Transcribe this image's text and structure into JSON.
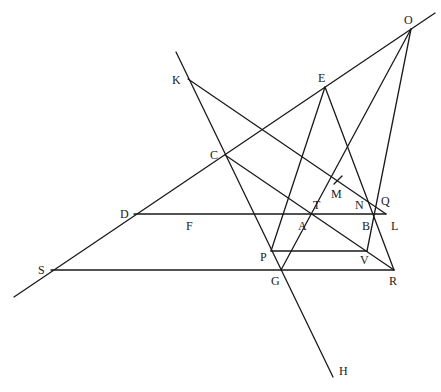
{
  "diagram": {
    "type": "geometric-construction",
    "stroke_color": "#1a1a1a",
    "background": "#ffffff",
    "points": [
      {
        "id": "O",
        "x": 411,
        "y": 29,
        "label_x": 404,
        "label_y": 24
      },
      {
        "id": "E",
        "x": 325,
        "y": 87,
        "label_x": 318,
        "label_y": 82
      },
      {
        "id": "K",
        "x": 188,
        "y": 79,
        "label_x": 172,
        "label_y": 84
      },
      {
        "id": "C",
        "x": 225,
        "y": 155,
        "label_x": 210,
        "label_y": 159
      },
      {
        "id": "M",
        "x": 338,
        "y": 180,
        "label_x": 331,
        "label_y": 198
      },
      {
        "id": "T",
        "x": 314,
        "y": 214,
        "label_x": 313,
        "label_y": 209
      },
      {
        "id": "N",
        "x": 369,
        "y": 214,
        "label_x": 355,
        "label_y": 209
      },
      {
        "id": "Q",
        "x": 372,
        "y": 205,
        "label_x": 381,
        "label_y": 205
      },
      {
        "id": "D",
        "x": 134,
        "y": 214,
        "label_x": 120,
        "label_y": 218
      },
      {
        "id": "F",
        "x": 197,
        "y": 214,
        "label_x": 186,
        "label_y": 230
      },
      {
        "id": "A",
        "x": 296,
        "y": 214,
        "label_x": 298,
        "label_y": 230
      },
      {
        "id": "B",
        "x": 374,
        "y": 214,
        "label_x": 362,
        "label_y": 230
      },
      {
        "id": "L",
        "x": 386,
        "y": 214,
        "label_x": 391,
        "label_y": 230
      },
      {
        "id": "P",
        "x": 271,
        "y": 251,
        "label_x": 260,
        "label_y": 261
      },
      {
        "id": "V",
        "x": 367,
        "y": 251,
        "label_x": 360,
        "label_y": 264
      },
      {
        "id": "S",
        "x": 51,
        "y": 270,
        "label_x": 38,
        "label_y": 274
      },
      {
        "id": "G",
        "x": 281,
        "y": 270,
        "label_x": 271,
        "label_y": 285
      },
      {
        "id": "R",
        "x": 394,
        "y": 270,
        "label_x": 389,
        "label_y": 285
      },
      {
        "id": "H",
        "x": 333,
        "y": 377,
        "label_x": 339,
        "label_y": 375
      }
    ],
    "lines": [
      {
        "name": "line-S-O-extended",
        "x1": 14,
        "y1": 297,
        "x2": 435,
        "y2": 13
      },
      {
        "name": "line-K-H",
        "x1": 176,
        "y1": 52,
        "x2": 333,
        "y2": 377
      },
      {
        "name": "line-K-L",
        "x1": 188,
        "y1": 79,
        "x2": 386,
        "y2": 214
      },
      {
        "name": "line-C-R",
        "x1": 225,
        "y1": 155,
        "x2": 394,
        "y2": 270
      },
      {
        "name": "line-D-L",
        "x1": 134,
        "y1": 214,
        "x2": 386,
        "y2": 214
      },
      {
        "name": "line-S-R",
        "x1": 51,
        "y1": 270,
        "x2": 394,
        "y2": 270
      },
      {
        "name": "line-P-V",
        "x1": 271,
        "y1": 251,
        "x2": 367,
        "y2": 251
      },
      {
        "name": "line-E-P",
        "x1": 325,
        "y1": 87,
        "x2": 271,
        "y2": 251
      },
      {
        "name": "line-E-R",
        "x1": 325,
        "y1": 87,
        "x2": 394,
        "y2": 270
      },
      {
        "name": "line-O-G",
        "x1": 411,
        "y1": 29,
        "x2": 281,
        "y2": 270
      },
      {
        "name": "line-O-V",
        "x1": 411,
        "y1": 29,
        "x2": 367,
        "y2": 251
      },
      {
        "name": "tick-M",
        "x1": 334,
        "y1": 184,
        "x2": 342,
        "y2": 176
      }
    ]
  }
}
